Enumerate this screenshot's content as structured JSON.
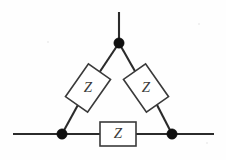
{
  "figure": {
    "background_color": "#fefefe",
    "wire_color": "#2b2b2b",
    "node_color": "#101010",
    "box_fill": "#ffffff",
    "box_stroke": "#3a3a3a",
    "label_color": "#3c3c3c"
  },
  "components": {
    "impedance_left": {
      "label": "Z",
      "name": "left-impedance",
      "shape": "rotated-rectangle",
      "rotation_deg": -55,
      "cx": 88,
      "cy": 88,
      "w": 40,
      "h": 27
    },
    "impedance_right": {
      "label": "Z",
      "name": "right-impedance",
      "shape": "rotated-rectangle",
      "rotation_deg": 55,
      "cx": 146,
      "cy": 88,
      "w": 40,
      "h": 27
    },
    "impedance_bottom": {
      "label": "Z",
      "name": "bottom-impedance",
      "shape": "rectangle",
      "rotation_deg": 0,
      "cx": 118,
      "cy": 134,
      "w": 36,
      "h": 24
    }
  },
  "nodes": [
    {
      "name": "top-node",
      "cx": 119,
      "cy": 43,
      "r": 5.2
    },
    {
      "name": "bottom-left-node",
      "cx": 62,
      "cy": 134,
      "r": 5.2
    },
    {
      "name": "bottom-right-node",
      "cx": 172,
      "cy": 134,
      "r": 5.2
    }
  ],
  "terminals": [
    {
      "name": "top-terminal-lead",
      "x1": 119,
      "y1": 12,
      "x2": 119,
      "y2": 43
    },
    {
      "name": "left-terminal-lead",
      "x1": 13,
      "y1": 134,
      "x2": 62,
      "y2": 134
    },
    {
      "name": "right-terminal-lead",
      "x1": 172,
      "y1": 134,
      "x2": 214,
      "y2": 134
    }
  ],
  "branches": [
    {
      "name": "top-to-left-upper-wire",
      "x1": 119,
      "y1": 43,
      "x2": 98,
      "y2": 74
    },
    {
      "name": "left-lower-to-bottom-left-wire",
      "x1": 78,
      "y1": 103,
      "x2": 62,
      "y2": 134
    },
    {
      "name": "top-to-right-upper-wire",
      "x1": 119,
      "y1": 43,
      "x2": 137,
      "y2": 74
    },
    {
      "name": "right-lower-to-bottom-right-wire",
      "x1": 156,
      "y1": 103,
      "x2": 172,
      "y2": 134
    },
    {
      "name": "bottom-left-to-box-wire",
      "x1": 62,
      "y1": 134,
      "x2": 100,
      "y2": 134
    },
    {
      "name": "box-to-bottom-right-wire",
      "x1": 136,
      "y1": 134,
      "x2": 172,
      "y2": 134
    }
  ]
}
